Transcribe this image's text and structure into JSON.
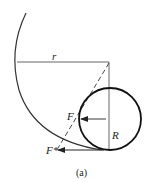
{
  "diagram": {
    "labels": {
      "r": "r",
      "R": "R",
      "F": "F",
      "F_star": "F*",
      "caption": "(a)"
    },
    "colors": {
      "stroke": "#222222",
      "thin_stroke": "#555555",
      "background": "#ffffff"
    },
    "elements": {
      "large_arc": "outer track arc of radius r",
      "small_circle": "wheel of radius R",
      "radius_line_r": "horizontal radius r",
      "vertical_line": "vertical line through circle center",
      "dashed_line": "dashed line from big-arc center to contact point",
      "force_F": "arrow F pointing left at circle center",
      "force_F_star": "arrow F* pointing left at contact point"
    }
  }
}
